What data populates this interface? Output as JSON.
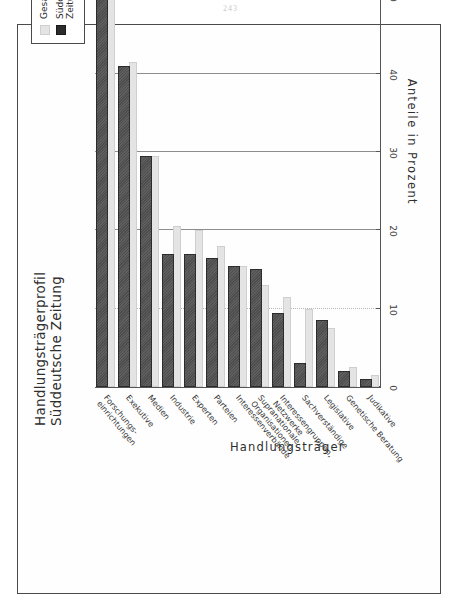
{
  "page": {
    "page_number": "243"
  },
  "chart_data": {
    "type": "bar",
    "title": "Handlungsträgerprofil\nSüddeutsche Zeitung",
    "xlabel": "Handlungsträger",
    "ylabel": "Anteile in Prozent",
    "orientation": "vertical-bars-rotated-90",
    "grid": true,
    "legend_position": "top-right",
    "ylim": [
      0,
      60
    ],
    "yticks": [
      0,
      10,
      20,
      30,
      40,
      50,
      60
    ],
    "ytick_labels": [
      "0",
      "10",
      "20",
      "30",
      "40",
      "50",
      "60"
    ],
    "categories": [
      "Forschungs-\neinrichtungen",
      "Exekutive",
      "Medien",
      "Industrie",
      "Experten",
      "Parteien",
      "Interessenverbände",
      "Supranationale\nOrganisationen",
      "Interessengruppen,\nNetzwerke",
      "Sachverständige",
      "Legislative",
      "Genetische Beratung",
      "Judikative"
    ],
    "series": [
      {
        "name": "Gesamt",
        "color": "#e4e4e4",
        "values": [
          53.0,
          41.5,
          29.5,
          20.5,
          20.0,
          18.0,
          15.5,
          13.0,
          11.5,
          10.0,
          7.5,
          2.5,
          1.5
        ]
      },
      {
        "name": "Süddeutsche Zeitung",
        "color": "#2c2c2c",
        "values": [
          54.0,
          41.0,
          29.5,
          17.0,
          17.0,
          16.5,
          15.5,
          15.0,
          9.5,
          3.0,
          8.5,
          2.0,
          1.0
        ]
      }
    ]
  },
  "legend": {
    "items": [
      {
        "label": "Gesamt"
      },
      {
        "label": "Süddeutsche\nZeitung"
      }
    ]
  }
}
